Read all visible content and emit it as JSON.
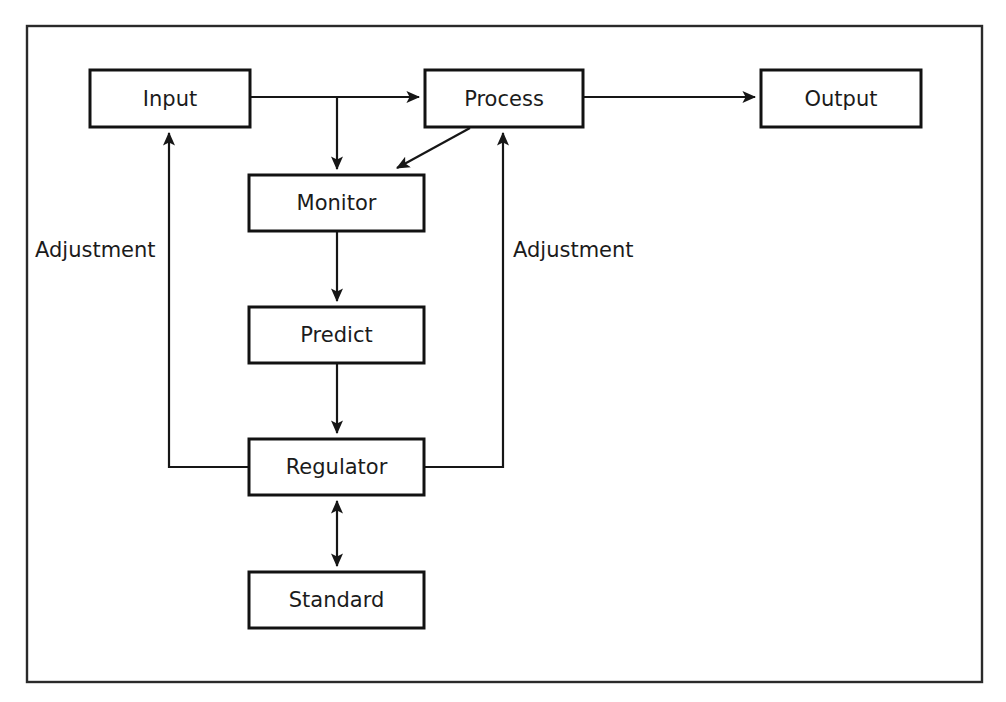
{
  "figure": {
    "kind": "block-diagram",
    "background_color": "#ffffff",
    "line_color": "#161616",
    "text_color": "#1b1b1b",
    "frame": {
      "x": 27,
      "y": 26,
      "width": 955,
      "height": 656
    }
  },
  "nodes": [
    {
      "id": "input",
      "label": "Input",
      "x": 90,
      "y": 70,
      "width": 160,
      "height": 57
    },
    {
      "id": "process",
      "label": "Process",
      "x": 425,
      "y": 70,
      "width": 158,
      "height": 57
    },
    {
      "id": "output",
      "label": "Output",
      "x": 761,
      "y": 70,
      "width": 160,
      "height": 57
    },
    {
      "id": "monitor",
      "label": "Monitor",
      "x": 249,
      "y": 175,
      "width": 175,
      "height": 56
    },
    {
      "id": "predict",
      "label": "Predict",
      "x": 249,
      "y": 307,
      "width": 175,
      "height": 56
    },
    {
      "id": "regulator",
      "label": "Regulator",
      "x": 249,
      "y": 439,
      "width": 175,
      "height": 56
    },
    {
      "id": "standard",
      "label": "Standard",
      "x": 249,
      "y": 572,
      "width": 175,
      "height": 56
    }
  ],
  "edges": [
    {
      "id": "input-to-process",
      "from": "input",
      "to": "process",
      "arrow": "single",
      "path": "M 250 97 L 419 97"
    },
    {
      "id": "input-to-monitor",
      "from": "input",
      "to": "monitor",
      "arrow": "single",
      "path": "M 337 97 L 337 169"
    },
    {
      "id": "process-to-output",
      "from": "process",
      "to": "output",
      "arrow": "single",
      "path": "M 583 97 L 755 97"
    },
    {
      "id": "process-to-monitor",
      "from": "process",
      "to": "monitor",
      "arrow": "single",
      "path": "M 470 128 L 397 168"
    },
    {
      "id": "monitor-to-predict",
      "from": "monitor",
      "to": "predict",
      "arrow": "single",
      "path": "M 337 231 L 337 301"
    },
    {
      "id": "predict-to-regulator",
      "from": "predict",
      "to": "regulator",
      "arrow": "single",
      "path": "M 337 363 L 337 433"
    },
    {
      "id": "regulator-to-standard",
      "from": "regulator",
      "to": "standard",
      "arrow": "double",
      "path": "M 337 501 L 337 566"
    },
    {
      "id": "regulator-to-input-adjustment",
      "from": "regulator",
      "to": "input",
      "arrow": "single",
      "label": "Adjustment",
      "path": "M 249 467 L 169 467 L 169 133"
    },
    {
      "id": "regulator-to-process-adjustment",
      "from": "regulator",
      "to": "process",
      "arrow": "single",
      "label": "Adjustment",
      "path": "M 424 467 L 503 467 L 503 133"
    }
  ],
  "edge_labels": [
    {
      "id": "adjustment-left",
      "text": "Adjustment",
      "x": 35,
      "y": 251
    },
    {
      "id": "adjustment-right",
      "text": "Adjustment",
      "x": 513,
      "y": 251
    }
  ]
}
